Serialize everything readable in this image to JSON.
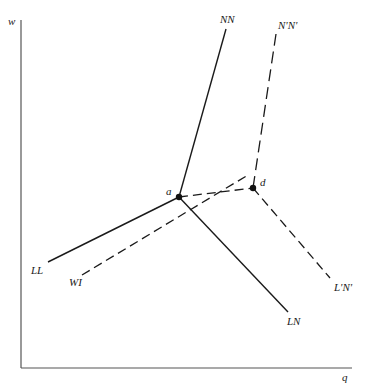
{
  "diagram": {
    "axes": {
      "y_label": "w",
      "x_label": "q"
    },
    "curves": [
      {
        "id": "NN",
        "label": "NN",
        "style": "solid"
      },
      {
        "id": "LL",
        "label": "LL",
        "style": "solid"
      },
      {
        "id": "LN",
        "label": "LN",
        "style": "solid"
      },
      {
        "id": "NpNp",
        "label": "N'N'",
        "style": "dashed"
      },
      {
        "id": "LpNp",
        "label": "L'N'",
        "style": "dashed"
      },
      {
        "id": "WI",
        "label": "WI",
        "style": "dashed"
      }
    ],
    "points": [
      {
        "id": "a",
        "label": "a"
      },
      {
        "id": "d",
        "label": "d"
      }
    ],
    "colors": {
      "line": "#1a1a1a",
      "axis": "#555555",
      "background": "#ffffff"
    }
  }
}
